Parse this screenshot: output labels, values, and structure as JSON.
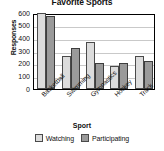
{
  "chart_data": {
    "type": "bar",
    "title": "Favorite Sports",
    "xlabel": "Sport",
    "ylabel": "Responses",
    "categories": [
      "Basketball",
      "Swimming",
      "Gymnastics",
      "Hockey",
      "Track"
    ],
    "series": [
      {
        "name": "Watching",
        "color": "#dcdcdc",
        "values": [
          600,
          260,
          370,
          175,
          255
        ]
      },
      {
        "name": "Participating",
        "color": "#9a9a9a",
        "values": [
          570,
          320,
          200,
          200,
          215
        ]
      }
    ],
    "ylim": [
      0,
      600
    ],
    "yticks": [
      0,
      100,
      200,
      300,
      400,
      500,
      600
    ],
    "ytick_labels": [
      "0",
      "100",
      "200",
      "300",
      "400",
      "500",
      "600"
    ],
    "grid": "horizontal",
    "legend_position": "bottom"
  }
}
